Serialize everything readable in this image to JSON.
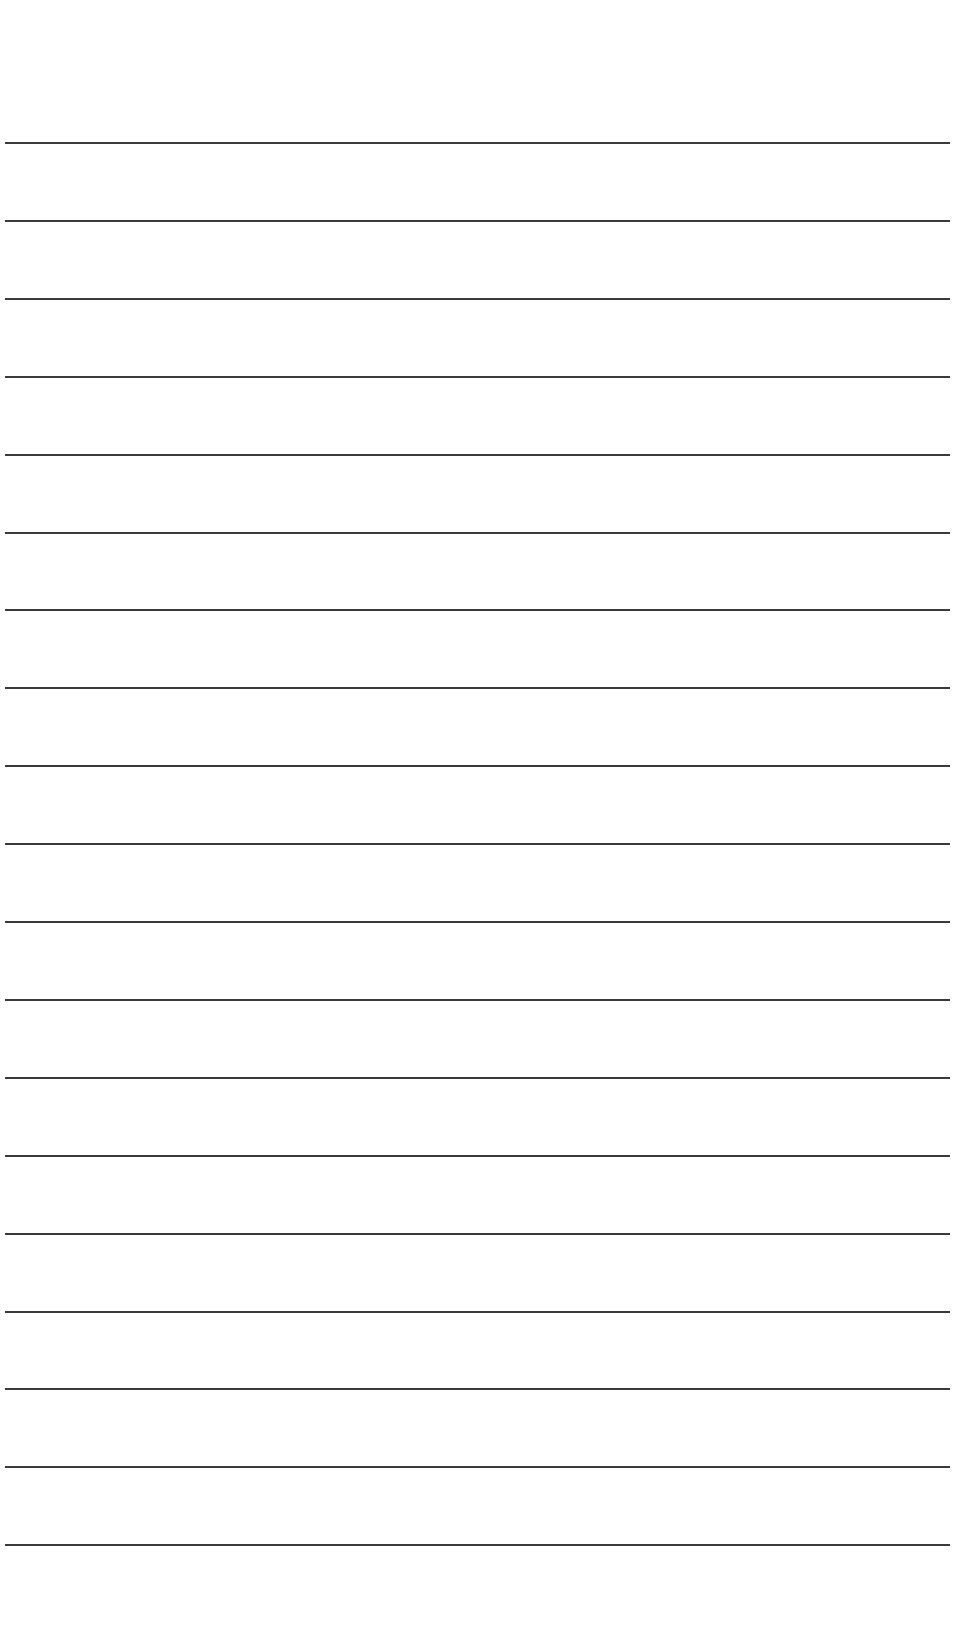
{
  "paper": {
    "type": "lined-paper",
    "line_count": 19,
    "line_color": "#3a3a3a",
    "background": "#ffffff",
    "first_line_y": 142,
    "line_spacing": 77.9
  }
}
